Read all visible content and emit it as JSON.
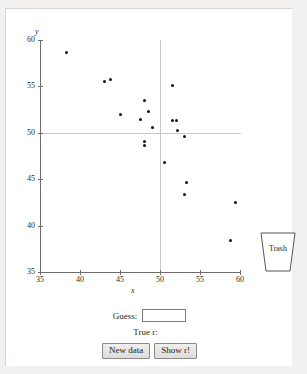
{
  "app": {
    "title": "Guess the Correlation",
    "background_color": "#f2f1ef",
    "panel_color": "#ffffff"
  },
  "chart_data": {
    "type": "scatter",
    "title": "",
    "xlabel": "x",
    "ylabel": "y",
    "xlim": [
      35,
      60
    ],
    "ylim": [
      35,
      60
    ],
    "xticks": [
      35,
      40,
      45,
      50,
      55,
      60
    ],
    "yticks": [
      35,
      40,
      45,
      50,
      55,
      60
    ],
    "grid": false,
    "reference_lines": {
      "horizontal": 50,
      "vertical": 50,
      "color": "#c9c9c9"
    },
    "legend": null,
    "point_color": "#111111",
    "points": [
      {
        "x": 38.3,
        "y": 58.6
      },
      {
        "x": 43.0,
        "y": 55.5
      },
      {
        "x": 43.8,
        "y": 55.7
      },
      {
        "x": 45.0,
        "y": 52.0
      },
      {
        "x": 47.5,
        "y": 51.4
      },
      {
        "x": 48.1,
        "y": 53.5
      },
      {
        "x": 48.5,
        "y": 52.3
      },
      {
        "x": 48.1,
        "y": 49.1
      },
      {
        "x": 48.1,
        "y": 48.6
      },
      {
        "x": 49.1,
        "y": 50.6
      },
      {
        "x": 50.6,
        "y": 46.8
      },
      {
        "x": 51.5,
        "y": 55.1
      },
      {
        "x": 51.6,
        "y": 51.3
      },
      {
        "x": 52.0,
        "y": 51.3
      },
      {
        "x": 52.2,
        "y": 50.3
      },
      {
        "x": 53.0,
        "y": 49.6
      },
      {
        "x": 53.3,
        "y": 44.6
      },
      {
        "x": 53.0,
        "y": 43.4
      },
      {
        "x": 59.4,
        "y": 42.5
      },
      {
        "x": 58.8,
        "y": 38.4
      }
    ]
  },
  "trash": {
    "label": "Trash"
  },
  "controls": {
    "guess_label": "Guess:",
    "guess_value": "",
    "guess_placeholder": "",
    "true_r_label": "True r:",
    "true_r_value": "",
    "new_data_label": "New data",
    "show_r_label": "Show r!"
  }
}
